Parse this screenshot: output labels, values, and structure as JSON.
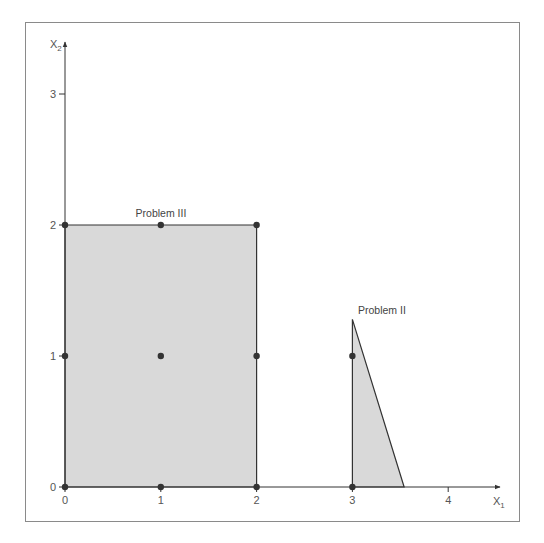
{
  "chart_data": {
    "type": "diagram",
    "title": "",
    "xlabel": "X1",
    "ylabel": "X2",
    "xlim": [
      0,
      4.45
    ],
    "ylim": [
      0,
      3.6
    ],
    "x_ticks": [
      "0",
      "1",
      "2",
      "3",
      "4"
    ],
    "y_ticks": [
      "0",
      "1",
      "2",
      "3"
    ],
    "grid": false,
    "regions": [
      {
        "name": "Problem III",
        "shape": "rectangle",
        "vertices": [
          [
            0,
            0
          ],
          [
            2,
            0
          ],
          [
            2,
            2
          ],
          [
            0,
            2
          ]
        ],
        "fill": "#d9d9d9",
        "label_pos": [
          1,
          2
        ]
      },
      {
        "name": "Problem II",
        "shape": "triangle",
        "vertices": [
          [
            3,
            0
          ],
          [
            3.54,
            0
          ],
          [
            3,
            1.28
          ]
        ],
        "fill": "#d9d9d9",
        "label_pos": [
          3,
          1.28
        ]
      }
    ],
    "points": [
      [
        0,
        0
      ],
      [
        1,
        0
      ],
      [
        2,
        0
      ],
      [
        0,
        1
      ],
      [
        1,
        1
      ],
      [
        2,
        1
      ],
      [
        0,
        2
      ],
      [
        1,
        2
      ],
      [
        2,
        2
      ],
      [
        3,
        0
      ],
      [
        3,
        1
      ]
    ]
  },
  "axes": {
    "x_label_main": "X",
    "x_label_sub": "1",
    "y_label_main": "X",
    "y_label_sub": "2",
    "x_tick_labels": [
      "0",
      "1",
      "2",
      "3",
      "4"
    ],
    "y_tick_labels": [
      "0",
      "1",
      "2",
      "3"
    ]
  },
  "labels": {
    "problem_3": "Problem III",
    "problem_2": "Problem II"
  },
  "colors": {
    "region_fill": "#d9d9d9",
    "line": "#333333",
    "point": "#333333",
    "frame": "#8a8a8a"
  }
}
